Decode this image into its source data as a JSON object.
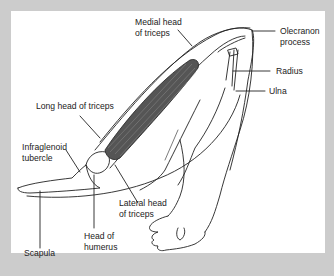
{
  "figure": {
    "colors": {
      "frame": "#cccccc",
      "panel": "#ffffff",
      "line": "#222222",
      "muscle_fill": "#555555"
    },
    "labels": {
      "medial_head": "Medial head\nof triceps",
      "olecranon": "Olecranon\nprocess",
      "radius": "Radius",
      "ulna": "Ulna",
      "long_head": "Long head of triceps",
      "infraglenoid": "Infraglenoid\ntubercle",
      "lateral_head": "Lateral head\nof triceps",
      "head_humerus": "Head of\nhumerus",
      "scapula": "Scapula"
    }
  }
}
